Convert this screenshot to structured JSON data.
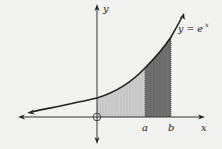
{
  "figure": {
    "function_label": "y = e",
    "function_exponent": "x",
    "x_axis_label": "x",
    "y_axis_label": "y",
    "point_a_label": "a",
    "point_b_label": "b",
    "origin_marker": "origin-circle"
  },
  "colors": {
    "background": "#f2f2f0",
    "curve": "#222222",
    "axes": "#333333",
    "light_region": "#c9c9c9",
    "dark_region": "#6e6e6e"
  },
  "regions": [
    {
      "name": "light-shaded-area",
      "from": "0",
      "to": "a"
    },
    {
      "name": "dark-shaded-area",
      "from": "a",
      "to": "b"
    }
  ]
}
